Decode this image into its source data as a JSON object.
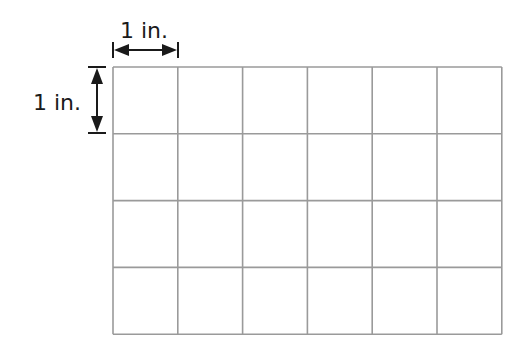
{
  "diagram": {
    "type": "unit-square-grid",
    "grid": {
      "columns": 6,
      "rows": 4,
      "line_color": "#9a9a9a",
      "x0": 113,
      "y0": 67,
      "cell_width": 64.8,
      "cell_height": 66.8
    },
    "dimensions": {
      "horizontal": {
        "label": "1 in."
      },
      "vertical": {
        "label": "1 in."
      }
    }
  }
}
